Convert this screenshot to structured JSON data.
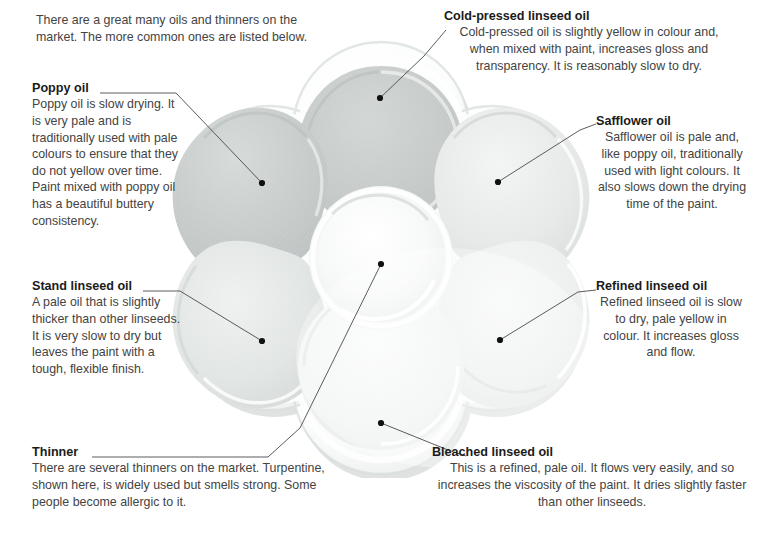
{
  "page": {
    "title": "Oils and thinners",
    "intro": "There are a great many oils and thinners on the market. The more common ones are listed below."
  },
  "artwork": {
    "name": "flower-shaped ceramic paint palette with six petal wells and a central round well",
    "petal_count": 6,
    "colors": {
      "petal_dark": "#c9cdcc",
      "petal_mid": "#dfe2e1",
      "petal_light": "#f1f3f2",
      "rim": "#ffffff",
      "shadow": "#bfc4c3",
      "background": "#ffffff"
    }
  },
  "leader_color": "#4a4a4a",
  "dot_color": "#111111",
  "annotations": [
    {
      "id": "poppy",
      "heading": "Poppy oil",
      "body": "Poppy oil is slow drying. It is very pale and is traditionally used with pale colours to ensure that they do not yellow over time. Paint mixed with poppy oil has a beautiful buttery consistency.",
      "dot": {
        "x": 262,
        "y": 183
      },
      "align": "left"
    },
    {
      "id": "cold-pressed",
      "heading": "Cold-pressed linseed oil",
      "body": "Cold-pressed oil is slightly yellow in colour and, when mixed with paint, increases gloss and transparency. It is reasonably slow to dry.",
      "dot": {
        "x": 380,
        "y": 98
      },
      "align": "center"
    },
    {
      "id": "safflower",
      "heading": "Safflower oil",
      "body": "Safflower oil is pale and, like poppy oil, traditionally used with light colours. It also slows down the drying time of the paint.",
      "dot": {
        "x": 498,
        "y": 182
      },
      "align": "center"
    },
    {
      "id": "stand",
      "heading": "Stand linseed oil",
      "body": "A pale oil that is slightly thicker than other linseeds. It is very slow to dry but leaves the paint with a tough, flexible finish.",
      "dot": {
        "x": 262,
        "y": 341
      },
      "align": "left"
    },
    {
      "id": "refined",
      "heading": "Refined linseed oil",
      "body": "Refined linseed oil is slow to dry, pale yellow in colour. It increases gloss and flow.",
      "dot": {
        "x": 500,
        "y": 340
      },
      "align": "center"
    },
    {
      "id": "thinner",
      "heading": "Thinner",
      "body": "There are several thinners on the market. Turpentine, shown here, is widely used but smells strong. Some people become allergic to it.",
      "dot": {
        "x": 381,
        "y": 264
      },
      "align": "left"
    },
    {
      "id": "bleached",
      "heading": "Bleached linseed oil",
      "body": "This is a refined, pale oil. It flows very easily, and so increases the viscosity of the paint. It dries slightly faster than other linseeds.",
      "dot": {
        "x": 381,
        "y": 423
      },
      "align": "center"
    }
  ]
}
